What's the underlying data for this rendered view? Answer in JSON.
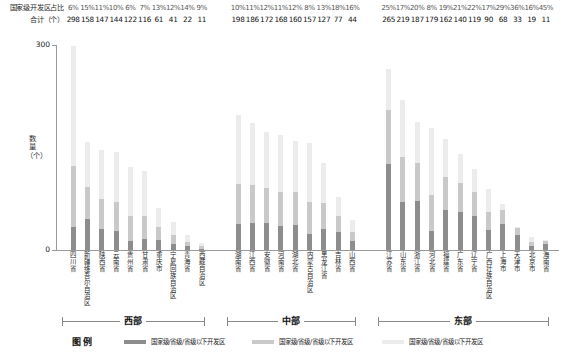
{
  "header": {
    "row_labels": [
      "国家级开发区占比",
      "合计（个）"
    ],
    "y_axis_label": "数量（个）",
    "y_ticks": [
      "300",
      "0"
    ],
    "y_max": 300
  },
  "regions": [
    {
      "name": "西部"
    },
    {
      "name": "中部"
    },
    {
      "name": "东部"
    }
  ],
  "legend": {
    "title": "图例",
    "items": [
      {
        "label": "国家级/省级/省级以下开发区",
        "color": "#8d8d8d"
      },
      {
        "label": "国家级/省级/省级以下开发区",
        "color": "#c9c9c9"
      },
      {
        "label": "国家级/省级/省级以下开发区",
        "color": "#ececec"
      }
    ]
  },
  "chart_data": {
    "type": "bar",
    "stacked": true,
    "title": "",
    "xlabel": "",
    "ylabel": "数量（个）",
    "ylim": [
      0,
      300
    ],
    "grid": false,
    "legend_position": "bottom",
    "series": [
      {
        "name": "国家级开发区",
        "color": "#8d8d8d"
      },
      {
        "name": "省级开发区",
        "color": "#c9c9c9"
      },
      {
        "name": "省级以下开发区",
        "color": "#ececec"
      }
    ],
    "groups": [
      {
        "region": "西部",
        "categories": [
          "四川省",
          "新疆维吾尔自治区",
          "陕西省",
          "云南省",
          "贵州省",
          "甘肃省",
          "重庆市",
          "宁夏回族自治区",
          "青海省",
          "西藏自治区"
        ],
        "national_share_pct": [
          "6%",
          "15%",
          "11%",
          "10%",
          "6%",
          "7%",
          "13%",
          "12%",
          "14%",
          "9%"
        ],
        "totals": [
          298,
          158,
          147,
          144,
          122,
          116,
          61,
          41,
          22,
          11
        ]
      },
      {
        "region": "中部",
        "categories": [
          "湖南省",
          "江西省",
          "安徽省",
          "河南省",
          "湖北省",
          "内蒙古自治区",
          "黑龙江省",
          "吉林省",
          "山西省"
        ],
        "national_share_pct": [
          "10%",
          "11%",
          "12%",
          "11%",
          "12%",
          "8%",
          "13%",
          "18%",
          "16%"
        ],
        "totals": [
          198,
          186,
          172,
          168,
          160,
          157,
          127,
          77,
          44
        ]
      },
      {
        "region": "东部",
        "categories": [
          "江苏省",
          "山东省",
          "浙江省",
          "河北省",
          "福建省",
          "广东省",
          "辽宁省",
          "广西壮族自治区",
          "上海市",
          "天津市",
          "北京市",
          "海南省"
        ],
        "national_share_pct": [
          "25%",
          "17%",
          "20%",
          "8%",
          "19%",
          "21%",
          "22%",
          "17%",
          "29%",
          "36%",
          "16%",
          "45%"
        ],
        "totals": [
          265,
          219,
          187,
          179,
          162,
          140,
          119,
          90,
          68,
          33,
          19,
          11
        ]
      }
    ]
  }
}
